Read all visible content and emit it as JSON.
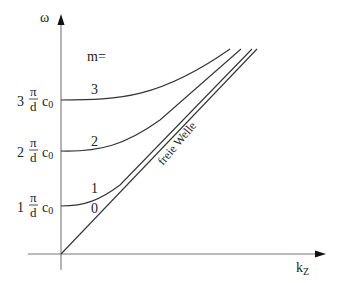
{
  "diagram": {
    "axes": {
      "y_label": "ω",
      "x_label_main": "k",
      "x_label_sub": "Z"
    },
    "mode_header": "m=",
    "levels": [
      {
        "coef": "1",
        "num": "π",
        "den": "d",
        "c": "c",
        "c_sub": "0"
      },
      {
        "coef": "2",
        "num": "π",
        "den": "d",
        "c": "c",
        "c_sub": "0"
      },
      {
        "coef": "3",
        "num": "π",
        "den": "d",
        "c": "c",
        "c_sub": "0"
      }
    ],
    "modes": [
      {
        "m": "0"
      },
      {
        "m": "1"
      },
      {
        "m": "2"
      },
      {
        "m": "3"
      }
    ],
    "free_wave_label": "freie Welle"
  }
}
